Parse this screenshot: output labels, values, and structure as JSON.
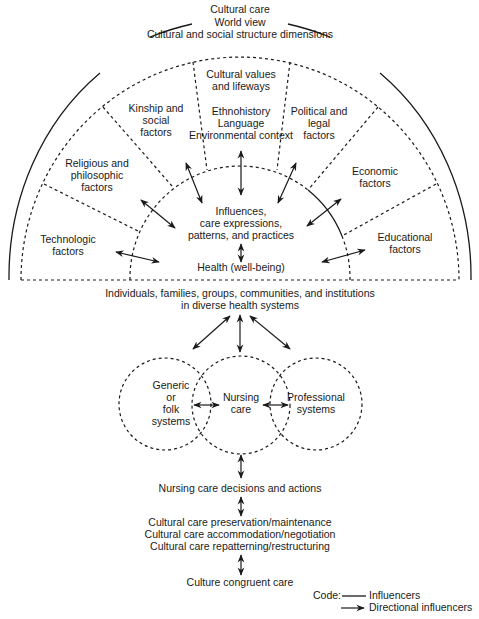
{
  "title_block": {
    "line1": "Cultural care",
    "line2": "World view",
    "line3": "Cultural and social structure dimensions"
  },
  "factors": {
    "cultural_values": [
      "Cultural values",
      "and lifeways"
    ],
    "center_top": [
      "Ethnohistory",
      "Language",
      "Environmental context"
    ],
    "kinship": [
      "Kinship and",
      "social",
      "factors"
    ],
    "political": [
      "Political and",
      "legal",
      "factors"
    ],
    "religious": [
      "Religious and",
      "philosophic",
      "factors"
    ],
    "economic": [
      "Economic",
      "factors"
    ],
    "technologic": [
      "Technologic",
      "factors"
    ],
    "educational": [
      "Educational",
      "factors"
    ]
  },
  "core": {
    "influences": [
      "Influences,",
      "care expressions,",
      "patterns, and practices"
    ],
    "health": "Health (well-being)"
  },
  "populations": [
    "Individuals, families, groups, communities, and institutions",
    "in diverse health systems"
  ],
  "systems": {
    "generic": [
      "Generic",
      "or",
      "folk",
      "systems"
    ],
    "nursing": [
      "Nursing",
      "care"
    ],
    "professional": [
      "Professional",
      "systems"
    ]
  },
  "decisions": "Nursing care decisions and actions",
  "modes": [
    "Cultural care preservation/maintenance",
    "Cultural care accommodation/negotiation",
    "Cultural care repatterning/restructuring"
  ],
  "outcome": "Culture congruent care",
  "legend": {
    "code_label": "Code:",
    "influencers": "Influencers",
    "directional": "Directional influencers"
  },
  "colors": {
    "line": "#1a1a1a",
    "background": "#ffffff"
  }
}
